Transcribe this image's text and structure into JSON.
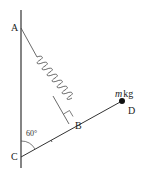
{
  "diagram": {
    "points": {
      "A": {
        "label": "A"
      },
      "B": {
        "label": "B"
      },
      "C": {
        "label": "C"
      },
      "D": {
        "label": "D"
      }
    },
    "mass_label_italic": "m",
    "mass_label_unit": "kg",
    "angle_label": "60°",
    "elements": [
      "vertical wall",
      "spring from A to B",
      "rod from C through B to D",
      "right angle marker at B",
      "point mass at D"
    ],
    "colors": {
      "line": "#333333",
      "background": "#ffffff"
    }
  }
}
